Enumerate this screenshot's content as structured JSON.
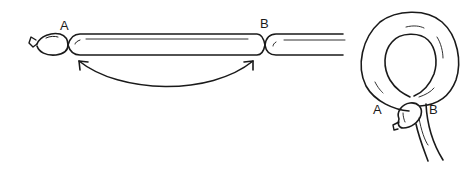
{
  "diagram": {
    "left_figure": {
      "labels": {
        "a": "A",
        "b": "B"
      },
      "arrow": "curved double-headed arrow between A and B"
    },
    "right_figure": {
      "labels": {
        "a": "A",
        "b": "B"
      },
      "shape": "loop with twisted joint"
    },
    "colors": {
      "ink": "#1a1a1a",
      "background": "#ffffff"
    }
  }
}
